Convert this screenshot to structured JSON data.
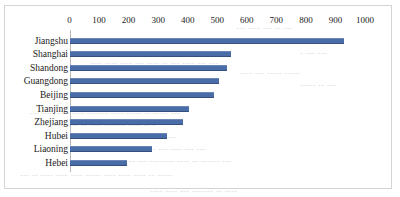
{
  "figure": {
    "border_color": "#d5d5d5",
    "background_color": "#ffffff",
    "bar_color": "#4a6da7"
  },
  "chart_data": {
    "type": "bar",
    "orientation": "horizontal",
    "title": "",
    "subtitle": "",
    "xlabel": "",
    "ylabel": "",
    "grid": false,
    "legend": null,
    "xlim": [
      0,
      1000
    ],
    "xticks": [
      0,
      100,
      200,
      300,
      400,
      500,
      600,
      700,
      800,
      900,
      1000
    ],
    "xtick_labels": [
      "0",
      "100",
      "200",
      "300",
      "400",
      "500",
      "600",
      "700",
      "800",
      "900",
      "1000"
    ],
    "categories": [
      "Jiangshu",
      "Shanghai",
      "Shandong",
      "Guangdong",
      "Beijing",
      "Tianjing",
      "Zhejiang",
      "Hubei",
      "Liaoning",
      "Hebei"
    ],
    "values": [
      930,
      545,
      532,
      505,
      488,
      404,
      383,
      329,
      279,
      194
    ],
    "annotations": []
  },
  "bleed_text": [
    {
      "x": 236,
      "y": 23,
      "text": "--- ---- --- -- ---"
    },
    {
      "x": 100,
      "y": 48,
      "text": "-- ---- --- ------ --- ---- ----- --- ----"
    },
    {
      "x": 300,
      "y": 48,
      "text": "- --- ---"
    },
    {
      "x": 90,
      "y": 58,
      "text": "---- ---- ---- --- ---- -- --- ---- --- ---"
    },
    {
      "x": 240,
      "y": 68,
      "text": "---- --- ----- -----"
    },
    {
      "x": 300,
      "y": 80,
      "text": "----- -- ---"
    },
    {
      "x": 30,
      "y": 108,
      "text": "--- ---- ---- ---- ------- ---- ----- -- ----- ---"
    },
    {
      "x": 36,
      "y": 120,
      "text": "---- ---- ---- -- ---- ------- ---- -- -"
    },
    {
      "x": 60,
      "y": 132,
      "text": "--- --- ---- --- -- ------ ---- -- ----"
    },
    {
      "x": 110,
      "y": 144,
      "text": "------ ----- -- --- ---- --- ---"
    },
    {
      "x": 96,
      "y": 156,
      "text": "--- ------ -- --- -------- ---- -- ------ ---"
    },
    {
      "x": 20,
      "y": 170,
      "text": "--- -- ---- ---- ---- ----- ---- ---- ---- -- -----"
    },
    {
      "x": 150,
      "y": 186,
      "text": "---- ---- --- ------- -- ----"
    }
  ]
}
